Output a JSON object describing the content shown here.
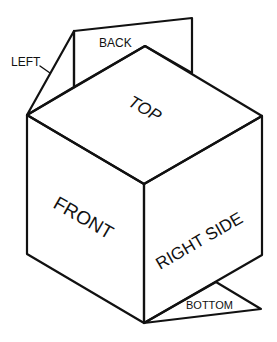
{
  "diagram": {
    "labels": {
      "top": "TOP",
      "front": "FRONT",
      "right": "RIGHT SIDE",
      "back": "BACK",
      "left": "LEFT",
      "bottom": "BOTTOM"
    },
    "colors": {
      "stroke": "#111111",
      "background": "#ffffff"
    }
  }
}
